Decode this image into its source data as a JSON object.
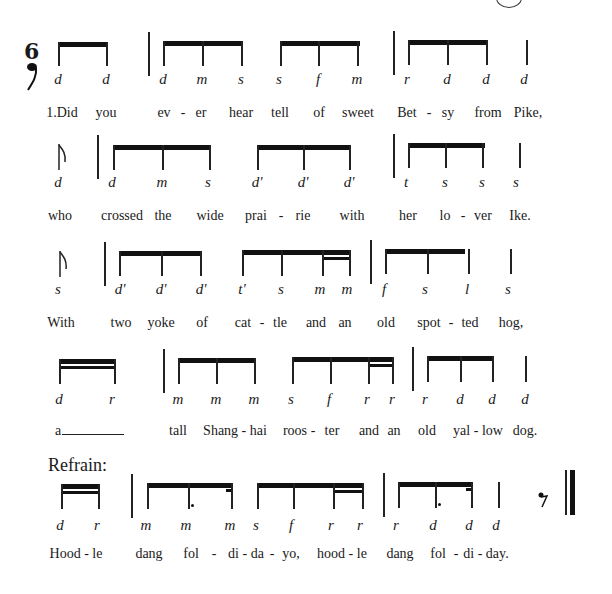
{
  "page": {
    "time_signature": "6",
    "time_signature_note": "eighth-note",
    "refrain_label": "Refrain:",
    "page_mark": "circle"
  },
  "rows": [
    {
      "solfege": [
        "d",
        "d",
        "d",
        "m",
        "s",
        "s",
        "f",
        "m",
        "r",
        "d",
        "d",
        "d"
      ],
      "lyrics": [
        "1.Did",
        "you",
        "ev",
        "-",
        "er",
        "hear",
        "tell",
        "of",
        "sweet",
        "Bet",
        "-",
        "sy",
        "from",
        "Pike,"
      ]
    },
    {
      "solfege": [
        "d",
        "d",
        "m",
        "s",
        "d'",
        "d'",
        "d'",
        "t",
        "s",
        "s",
        "s"
      ],
      "lyrics": [
        "who",
        "crossed",
        "the",
        "wide",
        "prai",
        "-",
        "rie",
        "with",
        "her",
        "lo",
        "-",
        "ver",
        "Ike."
      ]
    },
    {
      "solfege": [
        "s",
        "d'",
        "d'",
        "d'",
        "t'",
        "s",
        "m",
        "m",
        "f",
        "s",
        "l",
        "s"
      ],
      "lyrics": [
        "With",
        "two",
        "yoke",
        "of",
        "cat",
        "-",
        "tle",
        "and",
        "an",
        "old",
        "spot",
        "-",
        "ted",
        "hog,"
      ]
    },
    {
      "solfege": [
        "d",
        "r",
        "m",
        "m",
        "m",
        "s",
        "f",
        "r",
        "r",
        "r",
        "d",
        "d",
        "d"
      ],
      "lyrics": [
        "a______",
        "tall",
        "Shang - hai",
        "roos",
        "-",
        "ter",
        "and",
        "an",
        "old",
        "yal - low",
        "dog."
      ]
    },
    {
      "solfege": [
        "d",
        "r",
        "m",
        "m",
        "m",
        "s",
        "f",
        "r",
        "r",
        "r",
        "d",
        "d",
        "d"
      ],
      "lyrics": [
        "Hood - le",
        "dang",
        "fol",
        "-",
        "di - da",
        "-",
        "yo,",
        "hood - le",
        "dang",
        "fol",
        "-",
        "di - day."
      ]
    }
  ]
}
